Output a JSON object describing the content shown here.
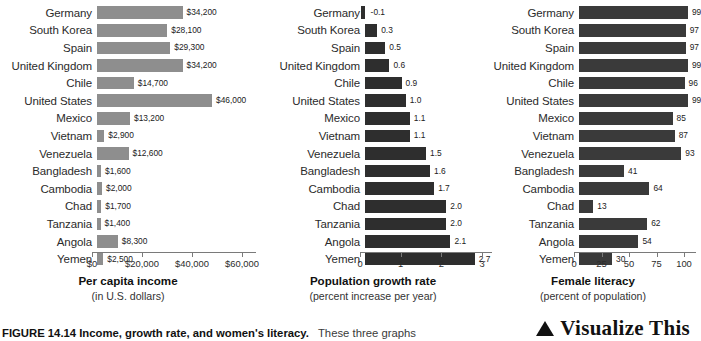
{
  "figure": {
    "caption_label": "FIGURE 14.14 Income, growth rate, and women's literacy.",
    "caption_rest": "These three graphs",
    "visualize_this": "Visualize This",
    "triangle_icon": "triangle-up-icon"
  },
  "chart_data": [
    {
      "type": "bar",
      "orientation": "horizontal",
      "title": "Per capita income",
      "subtitle": "(in U.S. dollars)",
      "xlabel": "Per capita income",
      "ylabel": "",
      "xlim": [
        0,
        60000
      ],
      "grid": false,
      "legend": "none",
      "bar_color": "#8e8e8e",
      "ticks": [
        "$0",
        "$20,000",
        "$40,000",
        "$60,000"
      ],
      "tick_values": [
        0,
        20000,
        40000,
        60000
      ],
      "categories": [
        "Germany",
        "South Korea",
        "Spain",
        "United Kingdom",
        "Chile",
        "United States",
        "Mexico",
        "Vietnam",
        "Venezuela",
        "Bangladesh",
        "Cambodia",
        "Chad",
        "Tanzania",
        "Angola",
        "Yemen"
      ],
      "values": [
        34200,
        28100,
        29300,
        34200,
        14700,
        46000,
        13200,
        2900,
        12600,
        1600,
        2000,
        1700,
        1400,
        8300,
        2500
      ],
      "labels": [
        "$34,200",
        "$28,100",
        "$29,300",
        "$34,200",
        "$14,700",
        "$46,000",
        "$13,200",
        "$2,900",
        "$12,600",
        "$1,600",
        "$2,000",
        "$1,700",
        "$1,400",
        "$8,300",
        "$2,500"
      ]
    },
    {
      "type": "bar",
      "orientation": "horizontal",
      "title": "Population growth rate",
      "subtitle": "(percent increase per year)",
      "xlabel": "Population growth rate",
      "ylabel": "",
      "xlim": [
        0,
        3
      ],
      "grid": false,
      "legend": "none",
      "bar_color": "#2e2e2e",
      "ticks": [
        "0",
        "1",
        "2",
        "3"
      ],
      "tick_values": [
        0,
        1,
        2,
        3
      ],
      "categories": [
        "Germany",
        "South Korea",
        "Spain",
        "United Kingdom",
        "Chile",
        "United States",
        "Mexico",
        "Vietnam",
        "Venezuela",
        "Bangladesh",
        "Cambodia",
        "Chad",
        "Tanzania",
        "Angola",
        "Yemen"
      ],
      "values": [
        -0.1,
        0.3,
        0.5,
        0.6,
        0.9,
        1.0,
        1.1,
        1.1,
        1.5,
        1.6,
        1.7,
        2.0,
        2.0,
        2.1,
        2.7
      ],
      "labels": [
        "-0.1",
        "0.3",
        "0.5",
        "0.6",
        "0.9",
        "1.0",
        "1.1",
        "1.1",
        "1.5",
        "1.6",
        "1.7",
        "2.0",
        "2.0",
        "2.1",
        "2.7"
      ]
    },
    {
      "type": "bar",
      "orientation": "horizontal",
      "title": "Female literacy",
      "subtitle": "(percent of population)",
      "xlabel": "Female literacy",
      "ylabel": "",
      "xlim": [
        0,
        100
      ],
      "grid": false,
      "legend": "none",
      "bar_color": "#3a3a3a",
      "ticks": [
        "0",
        "25",
        "50",
        "75",
        "100"
      ],
      "tick_values": [
        0,
        25,
        50,
        75,
        100
      ],
      "categories": [
        "Germany",
        "South Korea",
        "Spain",
        "United Kingdom",
        "Chile",
        "United States",
        "Mexico",
        "Vietnam",
        "Venezuela",
        "Bangladesh",
        "Cambodia",
        "Chad",
        "Tanzania",
        "Angola",
        "Yemen"
      ],
      "values": [
        99,
        97,
        97,
        99,
        96,
        99,
        85,
        87,
        93,
        41,
        64,
        13,
        62,
        54,
        30
      ],
      "labels": [
        "99",
        "97",
        "97",
        "99",
        "96",
        "99",
        "85",
        "87",
        "93",
        "41",
        "64",
        "13",
        "62",
        "54",
        "30"
      ]
    }
  ]
}
